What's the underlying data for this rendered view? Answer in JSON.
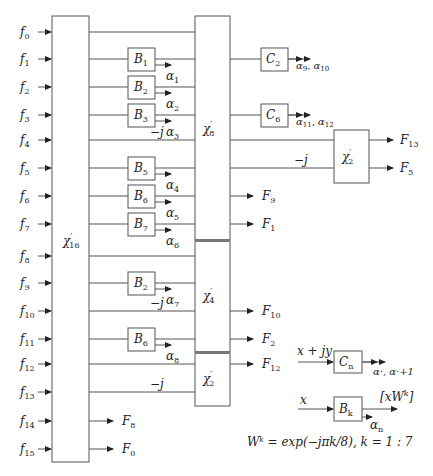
{
  "diagram": {
    "inputs": [
      {
        "base": "f",
        "sub": "0",
        "y": 32
      },
      {
        "base": "f",
        "sub": "1",
        "y": 59
      },
      {
        "base": "f",
        "sub": "2",
        "y": 87
      },
      {
        "base": "f",
        "sub": "3",
        "y": 115
      },
      {
        "base": "f",
        "sub": "4",
        "y": 140
      },
      {
        "base": "f",
        "sub": "5",
        "y": 168
      },
      {
        "base": "f",
        "sub": "6",
        "y": 196
      },
      {
        "base": "f",
        "sub": "7",
        "y": 224
      },
      {
        "base": "f",
        "sub": "8",
        "y": 256
      },
      {
        "base": "f",
        "sub": "9",
        "y": 283
      },
      {
        "base": "f",
        "sub": "10",
        "y": 311
      },
      {
        "base": "f",
        "sub": "11",
        "y": 339
      },
      {
        "base": "f",
        "sub": "12",
        "y": 364
      },
      {
        "base": "f",
        "sub": "13",
        "y": 392
      },
      {
        "base": "f",
        "sub": "14",
        "y": 421
      },
      {
        "base": "f",
        "sub": "15",
        "y": 449
      }
    ],
    "blocks": {
      "chi16": {
        "base": "χ",
        "prime": "′",
        "sub": "16"
      },
      "chi8": {
        "base": "χ",
        "prime": "′",
        "sub": "8"
      },
      "chi4": {
        "base": "χ",
        "prime": "′",
        "sub": "4"
      },
      "chi2_lower": {
        "base": "χ",
        "prime": "′",
        "sub": "2"
      },
      "chi2_right": {
        "base": "χ",
        "prime": "′",
        "sub": "2"
      }
    },
    "b_blocks": [
      {
        "base": "B",
        "sub": "1",
        "y": 59,
        "alpha": "1"
      },
      {
        "base": "B",
        "sub": "2",
        "y": 87,
        "alpha": "2"
      },
      {
        "base": "B",
        "sub": "3",
        "y": 115,
        "alpha": "3"
      },
      {
        "base": "B",
        "sub": "5",
        "y": 168,
        "alpha": "4"
      },
      {
        "base": "B",
        "sub": "6",
        "y": 196,
        "alpha": "5"
      },
      {
        "base": "B",
        "sub": "7",
        "y": 224,
        "alpha": "6"
      },
      {
        "base": "B",
        "sub": "2",
        "y": 283,
        "alpha": "7"
      },
      {
        "base": "B",
        "sub": "6",
        "y": 339,
        "alpha": "8"
      }
    ],
    "c_blocks": [
      {
        "base": "C",
        "sub": "2",
        "y": 59,
        "out": "α9, α10",
        "o1": "9",
        "o2": "10"
      },
      {
        "base": "C",
        "sub": "6",
        "y": 115,
        "out": "α11, α12",
        "o1": "11",
        "o2": "12"
      }
    ],
    "twiddles": [
      {
        "label": "−j",
        "x": 150,
        "y": 136
      },
      {
        "label": "−j",
        "x": 294,
        "y": 164
      },
      {
        "label": "−j",
        "x": 150,
        "y": 307
      },
      {
        "label": "−j",
        "x": 150,
        "y": 388
      }
    ],
    "outputs": [
      {
        "base": "F",
        "sub": "13",
        "x": 376,
        "y": 140
      },
      {
        "base": "F",
        "sub": "5",
        "x": 376,
        "y": 168
      },
      {
        "base": "F",
        "sub": "9",
        "x": 262,
        "y": 196
      },
      {
        "base": "F",
        "sub": "1",
        "x": 262,
        "y": 224
      },
      {
        "base": "F",
        "sub": "10",
        "x": 262,
        "y": 311
      },
      {
        "base": "F",
        "sub": "2",
        "x": 262,
        "y": 339
      },
      {
        "base": "F",
        "sub": "12",
        "x": 262,
        "y": 364
      },
      {
        "base": "F",
        "sub": "8",
        "x": 122,
        "y": 421
      },
      {
        "base": "F",
        "sub": "0",
        "x": 122,
        "y": 449
      }
    ],
    "legend": {
      "cn": {
        "input": "x + jy",
        "block_base": "C",
        "block_sub": "n",
        "output": "α·, α·+1"
      },
      "bk": {
        "input": "x",
        "block_base": "B",
        "block_sub": "k",
        "output_top": "[xW",
        "output_top_sup": "k",
        "output_top_end": "]",
        "output_bottom": "α",
        "output_bottom_sub": "n"
      },
      "formula": "Wᵏ = exp(−jπk/8), k = 1 : 7"
    }
  }
}
